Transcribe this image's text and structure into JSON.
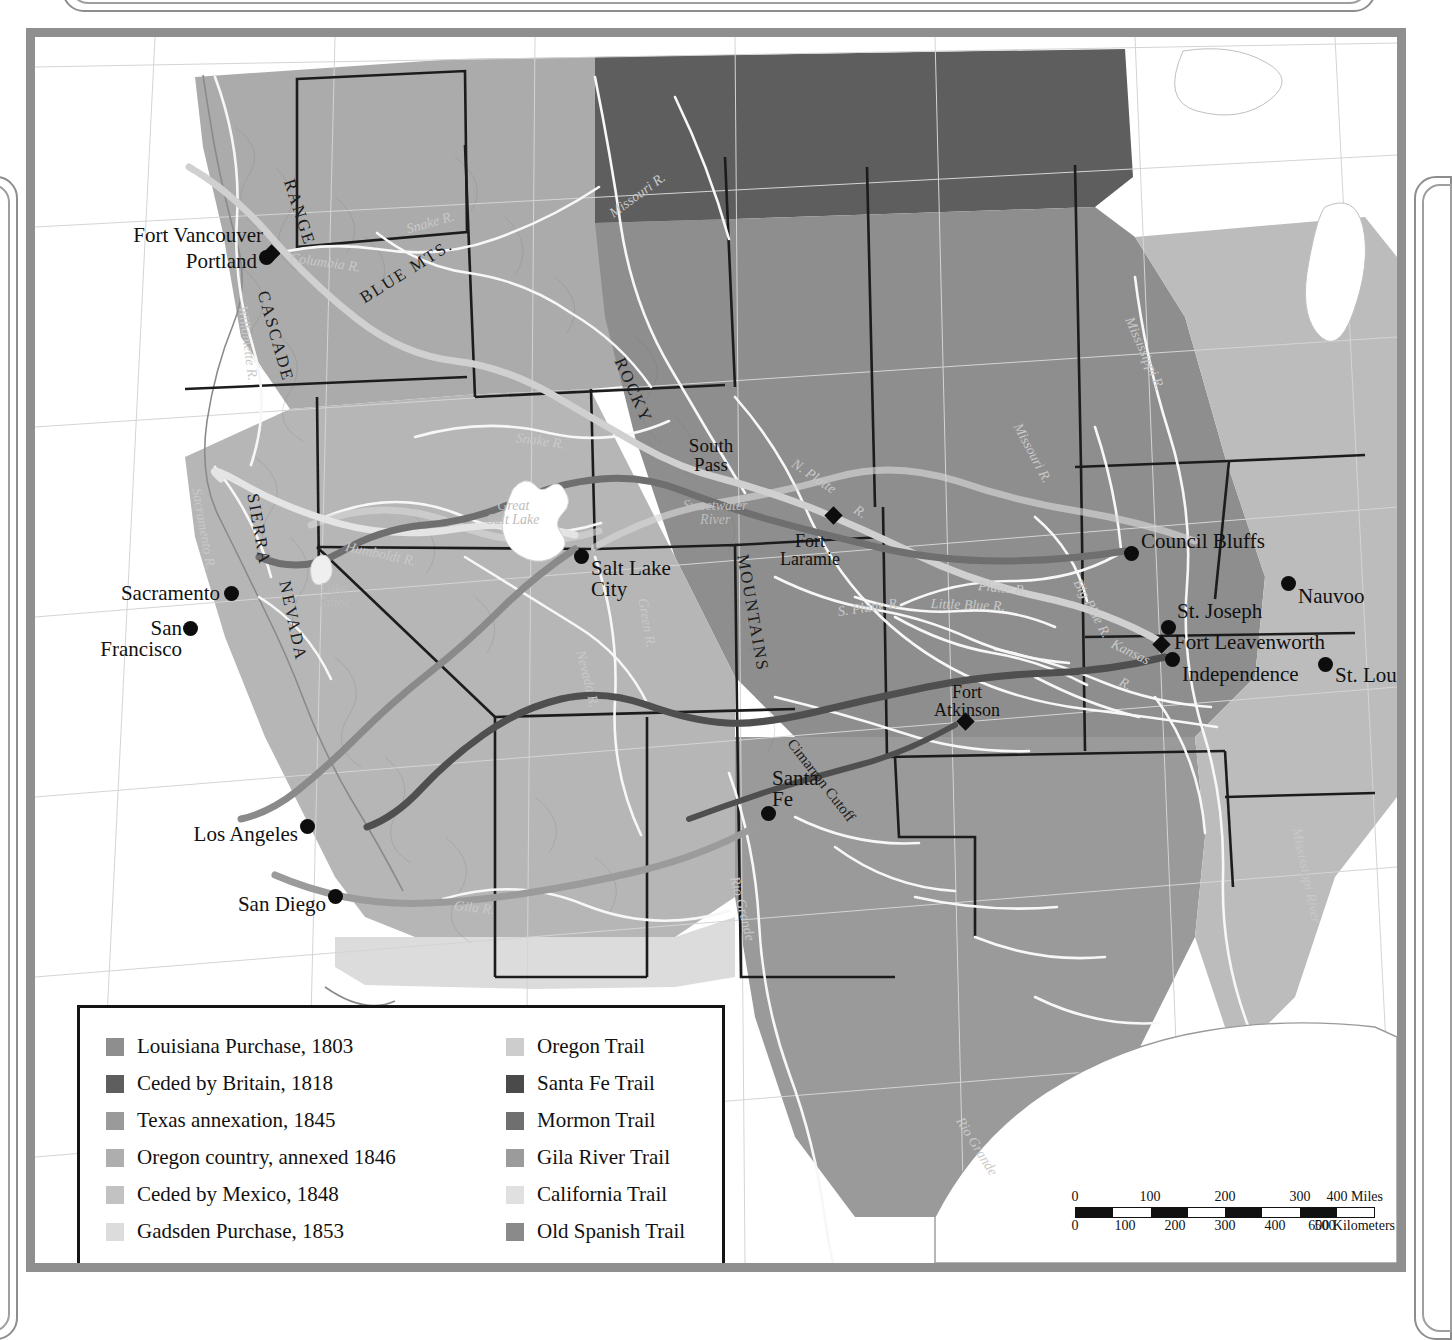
{
  "map": {
    "title_partial": "Westward Expansion, 1800–1860",
    "cities": [
      {
        "name": "Fort Vancouver",
        "type": "fort",
        "x": 236,
        "y": 216,
        "label_x": 228,
        "label_y": 188,
        "align": "right"
      },
      {
        "name": "Portland",
        "type": "city",
        "x": 231,
        "y": 220,
        "label_x": 222,
        "label_y": 214,
        "align": "right"
      },
      {
        "name": "Sacramento",
        "type": "city",
        "x": 196,
        "y": 556,
        "label_x": 185,
        "label_y": 546,
        "align": "right"
      },
      {
        "name": "San\nFrancisco",
        "type": "city",
        "x": 155,
        "y": 591,
        "label_x": 147,
        "label_y": 581,
        "align": "right"
      },
      {
        "name": "Los Angeles",
        "type": "city",
        "x": 272,
        "y": 789,
        "label_x": 263,
        "label_y": 787,
        "align": "right"
      },
      {
        "name": "San Diego",
        "type": "city",
        "x": 300,
        "y": 859,
        "label_x": 291,
        "label_y": 857,
        "align": "right"
      },
      {
        "name": "Salt Lake\nCity",
        "type": "city",
        "x": 546,
        "y": 519,
        "label_x": 556,
        "label_y": 521,
        "align": "left"
      },
      {
        "name": "Santa\nFe",
        "type": "city",
        "x": 733,
        "y": 776,
        "label_x": 737,
        "label_y": 731,
        "align": "left"
      },
      {
        "name": "Council Bluffs",
        "type": "city",
        "x": 1096,
        "y": 516,
        "label_x": 1106,
        "label_y": 494,
        "align": "left"
      },
      {
        "name": "Nauvoo",
        "type": "city",
        "x": 1253,
        "y": 546,
        "label_x": 1263,
        "label_y": 549,
        "align": "left"
      },
      {
        "name": "St. Joseph",
        "type": "city",
        "x": 1133,
        "y": 590,
        "label_x": 1142,
        "label_y": 564,
        "align": "left"
      },
      {
        "name": "Fort Leavenworth",
        "type": "fort",
        "x": 1126,
        "y": 607,
        "label_x": 1139,
        "label_y": 595,
        "align": "left"
      },
      {
        "name": "Independence",
        "type": "city",
        "x": 1137,
        "y": 622,
        "label_x": 1147,
        "label_y": 627,
        "align": "left"
      },
      {
        "name": "St. Louis",
        "type": "city",
        "x": 1290,
        "y": 627,
        "label_x": 1300,
        "label_y": 628,
        "align": "left"
      },
      {
        "name": "Fort\nLaramie",
        "type": "fort",
        "x": 798,
        "y": 478,
        "label_x": 775,
        "label_y": 495,
        "align": "center"
      },
      {
        "name": "Fort\nAtkinson",
        "type": "fort",
        "x": 930,
        "y": 684,
        "label_x": 932,
        "label_y": 646,
        "align": "center"
      }
    ],
    "features": [
      {
        "label": "South\nPass",
        "x": 676,
        "y": 399,
        "kind": "pass"
      },
      {
        "label": "Cimarron Cutoff",
        "x": 786,
        "y": 736,
        "kind": "cutoff",
        "rotate": 52
      }
    ],
    "ranges": [
      {
        "label": "CASCADE",
        "x": 236,
        "y": 252,
        "rotate": 74
      },
      {
        "label": "RANGE",
        "x": 262,
        "y": 140,
        "rotate": 72
      },
      {
        "label": "BLUE MTS.",
        "x": 322,
        "y": 255,
        "rotate": -32
      },
      {
        "label": "SIERRA",
        "x": 226,
        "y": 455,
        "rotate": 80
      },
      {
        "label": "NEVADA",
        "x": 258,
        "y": 542,
        "rotate": 78
      },
      {
        "label": "ROCKY",
        "x": 592,
        "y": 318,
        "rotate": 66
      },
      {
        "label": "MOUNTAINS",
        "x": 716,
        "y": 516,
        "rotate": 80
      }
    ],
    "rivers": [
      {
        "label": "Columbia R.",
        "x": 256,
        "y": 214,
        "rotate": 8
      },
      {
        "label": "Willamette R.",
        "x": 214,
        "y": 268,
        "rotate": 82
      },
      {
        "label": "Snake R.",
        "x": 370,
        "y": 186,
        "rotate": -16
      },
      {
        "label": "Snake R.",
        "x": 482,
        "y": 394,
        "rotate": 8
      },
      {
        "label": "Missouri R.",
        "x": 572,
        "y": 172,
        "rotate": -36
      },
      {
        "label": "Missouri R.",
        "x": 988,
        "y": 384,
        "rotate": 62
      },
      {
        "label": "Mississippi R.",
        "x": 1100,
        "y": 278,
        "rotate": 66
      },
      {
        "label": "Mississippi River",
        "x": 1268,
        "y": 790,
        "rotate": 78
      },
      {
        "label": "Sacramento R.",
        "x": 168,
        "y": 450,
        "rotate": 80
      },
      {
        "label": "Humboldt R.",
        "x": 312,
        "y": 503,
        "rotate": 12
      },
      {
        "label": "Great\nSalt Lake",
        "x": 452,
        "y": 462,
        "rotate": 0
      },
      {
        "label": "Lake\nTahoe",
        "x": 282,
        "y": 545,
        "rotate": 0
      },
      {
        "label": "Sweetwater\nRiver",
        "x": 648,
        "y": 462,
        "rotate": 0
      },
      {
        "label": "N. Platte",
        "x": 762,
        "y": 420,
        "rotate": 34
      },
      {
        "label": "R.",
        "x": 824,
        "y": 466,
        "rotate": 34
      },
      {
        "label": "Platte R.",
        "x": 944,
        "y": 542,
        "rotate": 6
      },
      {
        "label": "S. Platte R.",
        "x": 802,
        "y": 568,
        "rotate": -8
      },
      {
        "label": "Little Blue R.",
        "x": 896,
        "y": 560,
        "rotate": 2
      },
      {
        "label": "Big Blue R.",
        "x": 1048,
        "y": 540,
        "rotate": 62
      },
      {
        "label": "Kansas",
        "x": 1080,
        "y": 600,
        "rotate": 26
      },
      {
        "label": "R.",
        "x": 1088,
        "y": 638,
        "rotate": 26
      },
      {
        "label": "Green R.",
        "x": 614,
        "y": 560,
        "rotate": 80
      },
      {
        "label": "Nevada R.",
        "x": 552,
        "y": 612,
        "rotate": 76
      },
      {
        "label": "Gila R.",
        "x": 420,
        "y": 862,
        "rotate": 6
      },
      {
        "label": "Rio Grande",
        "x": 706,
        "y": 838,
        "rotate": 76
      },
      {
        "label": "Rio Grande",
        "x": 930,
        "y": 1078,
        "rotate": 58
      }
    ]
  },
  "legend": {
    "territories": [
      {
        "label": "Louisiana Purchase, 1803",
        "color": "#8e8e8e"
      },
      {
        "label": "Ceded by Britain, 1818",
        "color": "#5e5e5e"
      },
      {
        "label": "Texas annexation, 1845",
        "color": "#9a9a9a"
      },
      {
        "label": "Oregon country, annexed 1846",
        "color": "#aeaeae"
      },
      {
        "label": "Ceded by Mexico, 1848",
        "color": "#c2c2c2"
      },
      {
        "label": "Gadsden Purchase, 1853",
        "color": "#dcdcdc"
      }
    ],
    "trails": [
      {
        "label": "Oregon Trail",
        "color": "#cdcdcd"
      },
      {
        "label": "Santa Fe Trail",
        "color": "#4a4a4a"
      },
      {
        "label": "Mormon Trail",
        "color": "#6f6f6f"
      },
      {
        "label": "Gila River Trail",
        "color": "#9b9b9b"
      },
      {
        "label": "California Trail",
        "color": "#e0e0e0"
      },
      {
        "label": "Old Spanish Trail",
        "color": "#8a8a8a"
      }
    ]
  },
  "scalebar": {
    "miles_label": "400 Miles",
    "miles_ticks": [
      "0",
      "100",
      "200",
      "300"
    ],
    "km_label": "600 Kilometers",
    "km_ticks": [
      "0",
      "100",
      "200",
      "300",
      "400",
      "500"
    ]
  }
}
